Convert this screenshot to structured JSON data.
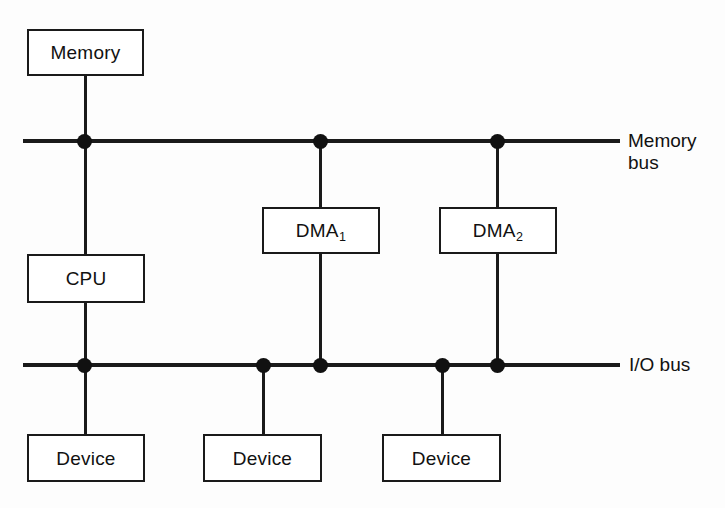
{
  "diagram": {
    "background_color": "#fdfdfd",
    "line_color": "#1a1a1a",
    "text_color": "#111111",
    "boxes": {
      "memory": {
        "label": "Memory"
      },
      "cpu": {
        "label": "CPU"
      },
      "dma1": {
        "label": "DMA",
        "subscript": "1"
      },
      "dma2": {
        "label": "DMA",
        "subscript": "2"
      },
      "device1": {
        "label": "Device"
      },
      "device2": {
        "label": "Device"
      },
      "device3": {
        "label": "Device"
      }
    },
    "buses": {
      "memory_bus": {
        "label": "Memory\nbus"
      },
      "io_bus": {
        "label": "I/O bus"
      }
    }
  }
}
